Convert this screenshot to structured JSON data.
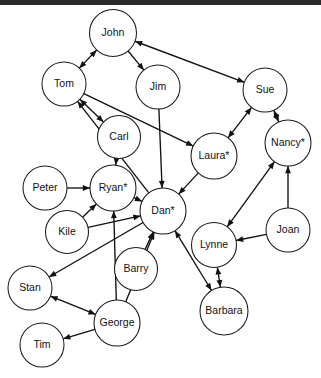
{
  "window": {
    "title": "Social Network Graph",
    "top_bar_color": "#2a2a2a",
    "background_color": "#ffffff",
    "width": 321,
    "height": 378
  },
  "graph": {
    "type": "directed-node-link-diagram",
    "node_stroke_color": "#1a1a1a",
    "edge_color": "#111111",
    "label_color": "#111111",
    "starred_marker": "*",
    "nodes": [
      {
        "id": "john",
        "label": "John",
        "x": 113,
        "y": 33,
        "r": 23.5,
        "starred": false
      },
      {
        "id": "tom",
        "label": "Tom",
        "x": 64,
        "y": 84,
        "r": 22,
        "starred": false
      },
      {
        "id": "jim",
        "label": "Jim",
        "x": 158,
        "y": 87,
        "r": 22,
        "starred": false
      },
      {
        "id": "sue",
        "label": "Sue",
        "x": 265,
        "y": 90,
        "r": 22,
        "starred": false
      },
      {
        "id": "carl",
        "label": "Carl",
        "x": 119,
        "y": 137,
        "r": 21.5,
        "starred": false
      },
      {
        "id": "laura",
        "label": "Laura*",
        "x": 214,
        "y": 156,
        "r": 23,
        "starred": true
      },
      {
        "id": "nancy",
        "label": "Nancy*",
        "x": 288,
        "y": 143,
        "r": 23,
        "starred": true
      },
      {
        "id": "peter",
        "label": "Peter",
        "x": 45,
        "y": 188,
        "r": 22,
        "starred": false
      },
      {
        "id": "ryan",
        "label": "Ryan*",
        "x": 113,
        "y": 188,
        "r": 23,
        "starred": true
      },
      {
        "id": "dan",
        "label": "Dan*",
        "x": 163,
        "y": 211,
        "r": 23,
        "starred": true
      },
      {
        "id": "kile",
        "label": "Kile",
        "x": 67,
        "y": 232,
        "r": 21.5,
        "starred": false
      },
      {
        "id": "lynne",
        "label": "Lynne",
        "x": 214,
        "y": 245,
        "r": 22.5,
        "starred": false
      },
      {
        "id": "joan",
        "label": "Joan",
        "x": 288,
        "y": 230,
        "r": 22,
        "starred": false
      },
      {
        "id": "barry",
        "label": "Barry",
        "x": 136,
        "y": 269,
        "r": 21.5,
        "starred": false
      },
      {
        "id": "stan",
        "label": "Stan",
        "x": 30,
        "y": 288,
        "r": 22,
        "starred": false
      },
      {
        "id": "barbara",
        "label": "Barbara",
        "x": 224,
        "y": 311,
        "r": 24,
        "starred": false
      },
      {
        "id": "george",
        "label": "George",
        "x": 117,
        "y": 323,
        "r": 23,
        "starred": false
      },
      {
        "id": "tim",
        "label": "Tim",
        "x": 42,
        "y": 345,
        "r": 22,
        "starred": false
      }
    ],
    "edges": [
      {
        "from": "tom",
        "to": "john",
        "bidirectional": true
      },
      {
        "from": "john",
        "to": "jim",
        "bidirectional": false
      },
      {
        "from": "sue",
        "to": "john",
        "bidirectional": true
      },
      {
        "from": "tom",
        "to": "carl",
        "bidirectional": true
      },
      {
        "from": "tom",
        "to": "laura",
        "bidirectional": false
      },
      {
        "from": "jim",
        "to": "dan",
        "bidirectional": false
      },
      {
        "from": "carl",
        "to": "ryan",
        "bidirectional": false
      },
      {
        "from": "laura",
        "to": "sue",
        "bidirectional": true
      },
      {
        "from": "sue",
        "to": "nancy",
        "bidirectional": true
      },
      {
        "from": "laura",
        "to": "dan",
        "bidirectional": false
      },
      {
        "from": "peter",
        "to": "ryan",
        "bidirectional": false
      },
      {
        "from": "ryan",
        "to": "dan",
        "bidirectional": false
      },
      {
        "from": "kile",
        "to": "ryan",
        "bidirectional": false
      },
      {
        "from": "kile",
        "to": "dan",
        "bidirectional": false
      },
      {
        "from": "dan",
        "to": "tom",
        "bidirectional": false
      },
      {
        "from": "dan",
        "to": "stan",
        "bidirectional": false
      },
      {
        "from": "barry",
        "to": "dan",
        "bidirectional": false
      },
      {
        "from": "george",
        "to": "dan",
        "bidirectional": false
      },
      {
        "from": "george",
        "to": "ryan",
        "bidirectional": false
      },
      {
        "from": "george",
        "to": "stan",
        "bidirectional": true
      },
      {
        "from": "george",
        "to": "tim",
        "bidirectional": false
      },
      {
        "from": "dan",
        "to": "barbara",
        "bidirectional": true
      },
      {
        "from": "lynne",
        "to": "nancy",
        "bidirectional": true
      },
      {
        "from": "lynne",
        "to": "barbara",
        "bidirectional": true
      },
      {
        "from": "joan",
        "to": "nancy",
        "bidirectional": false
      },
      {
        "from": "joan",
        "to": "lynne",
        "bidirectional": false
      }
    ]
  }
}
